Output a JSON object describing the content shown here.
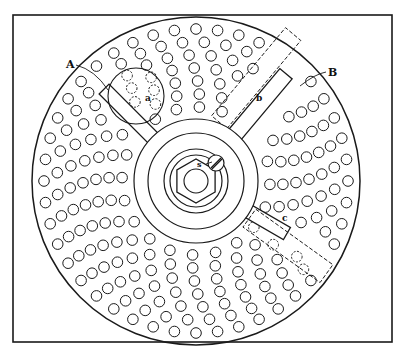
{
  "figure": {
    "frame": {
      "x": 13,
      "y": 15,
      "w": 379,
      "h": 327
    },
    "stroke_color": "#1a1a1a",
    "background": "#ffffff",
    "disc": {
      "cx": 196,
      "cy": 181,
      "r": 164
    },
    "hole_radius": 5.3,
    "hole_rings": [
      {
        "r": 152,
        "count": 44
      },
      {
        "r": 139,
        "count": 40
      },
      {
        "r": 126,
        "count": 36
      },
      {
        "r": 113,
        "count": 32
      },
      {
        "r": 100,
        "count": 28
      },
      {
        "r": 87,
        "count": 24
      },
      {
        "r": 74,
        "count": 20
      }
    ],
    "hub": {
      "rings": [
        62,
        48,
        32,
        26
      ],
      "nut_r": 22,
      "bore_r": 12
    },
    "screw": {
      "cx": 216,
      "cy": 163,
      "r": 8
    },
    "labels": {
      "A": "A",
      "B": "B",
      "a": "a",
      "b": "b",
      "c": "c",
      "s": "s"
    }
  }
}
